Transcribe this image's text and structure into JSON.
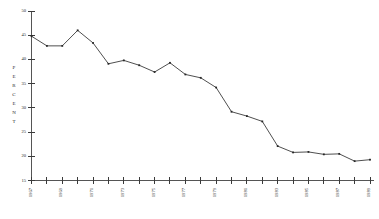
{
  "chart_data": {
    "type": "line",
    "title": "",
    "xlabel": "",
    "ylabel": "PERCENT",
    "ylim": [
      15,
      50
    ],
    "yticks": [
      15,
      20,
      25,
      30,
      35,
      40,
      45,
      50
    ],
    "ytick_labels": [
      "15",
      "20",
      "25",
      "30",
      "35",
      "40",
      "45",
      "50"
    ],
    "xlim": [
      1967,
      1989
    ],
    "xticks": [
      1967,
      1968,
      1969,
      1970,
      1971,
      1972,
      1973,
      1974,
      1975,
      1976,
      1977,
      1978,
      1979,
      1980,
      1981,
      1982,
      1983,
      1984,
      1985,
      1986,
      1987,
      1988,
      1989
    ],
    "xtick_labels_shown": [
      "1967",
      "1969",
      "1971",
      "1973",
      "1975",
      "1977",
      "1979",
      "1981",
      "1983",
      "1985",
      "1987",
      "1989"
    ],
    "xtick_label_rotation": 90,
    "grid": false,
    "legend": false,
    "markers": "filled-square",
    "categories": [
      1967,
      1968,
      1969,
      1970,
      1971,
      1972,
      1973,
      1974,
      1975,
      1976,
      1977,
      1978,
      1979,
      1980,
      1981,
      1982,
      1983,
      1984,
      1985,
      1986,
      1987,
      1988,
      1989
    ],
    "values": [
      44.8,
      42.8,
      42.8,
      46.0,
      43.4,
      39.1,
      39.8,
      38.8,
      37.4,
      39.3,
      36.9,
      36.2,
      34.2,
      29.2,
      28.3,
      27.2,
      22.1,
      20.8,
      20.9,
      20.4,
      20.5,
      19.0,
      19.3
    ],
    "series": [
      {
        "name": "percent",
        "values": [
          44.8,
          42.8,
          42.8,
          46.0,
          43.4,
          39.1,
          39.8,
          38.8,
          37.4,
          39.3,
          36.9,
          36.2,
          34.2,
          29.2,
          28.3,
          27.2,
          22.1,
          20.8,
          20.9,
          20.4,
          20.5,
          19.0,
          19.3
        ]
      }
    ],
    "colors": {
      "line": "#3b3b3b",
      "marker": "#262626",
      "axis": "#555555",
      "text": "#2b2b2b",
      "background": "#ffffff"
    }
  },
  "axis": {
    "y_title_characters": [
      "P",
      "E",
      "R",
      "C",
      "E",
      "N",
      "T"
    ]
  }
}
